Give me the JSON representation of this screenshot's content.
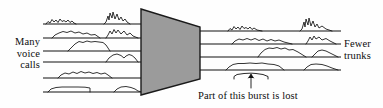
{
  "figure": {
    "background_color": "#fefefe",
    "line_color": "#111111",
    "funnel_fill_color": "#9b9b9b",
    "funnel_stroke_color": "#1a1a1a"
  },
  "labels": {
    "left": {
      "line1": "Many",
      "line2": "voice",
      "line3": "calls"
    },
    "right": {
      "line1": "Fewer",
      "line2": "trunks"
    },
    "caption": "Part of this burst is lost"
  },
  "diagram_data": {
    "type": "schematic",
    "input_channel_count": 6,
    "output_channel_count": 4,
    "input_lines": [
      {
        "index": 0,
        "y": 24,
        "x_start": 43,
        "x_end": 141,
        "bursts": [
          {
            "x": 46,
            "width": 30,
            "height": 6,
            "style": "spiky"
          },
          {
            "x": 104,
            "width": 26,
            "height": 12,
            "style": "spiky-tall"
          }
        ]
      },
      {
        "index": 1,
        "y": 38,
        "x_start": 43,
        "x_end": 141,
        "bursts": [
          {
            "x": 52,
            "width": 48,
            "height": 7,
            "style": "rounded"
          },
          {
            "x": 106,
            "width": 32,
            "height": 9,
            "style": "spiky"
          }
        ]
      },
      {
        "index": 2,
        "y": 51,
        "x_start": 43,
        "x_end": 141,
        "bursts": [
          {
            "x": 68,
            "width": 42,
            "height": 10,
            "style": "rounded"
          }
        ]
      },
      {
        "index": 3,
        "y": 62,
        "x_start": 43,
        "x_end": 141,
        "bursts": [
          {
            "x": 106,
            "width": 32,
            "height": 8,
            "style": "rounded"
          }
        ]
      },
      {
        "index": 4,
        "y": 78,
        "x_start": 43,
        "x_end": 141,
        "bursts": [
          {
            "x": 58,
            "width": 54,
            "height": 7,
            "style": "spiky"
          }
        ]
      },
      {
        "index": 5,
        "y": 92,
        "x_start": 43,
        "x_end": 141,
        "bursts": [
          {
            "x": 48,
            "width": 42,
            "height": 6,
            "style": "flat"
          },
          {
            "x": 114,
            "width": 28,
            "height": 6,
            "style": "rounded"
          }
        ]
      }
    ],
    "output_lines": [
      {
        "index": 0,
        "y": 31,
        "x_start": 200,
        "x_end": 341,
        "bursts": [
          {
            "x": 228,
            "width": 36,
            "height": 6,
            "style": "spiky"
          },
          {
            "x": 300,
            "width": 32,
            "height": 13,
            "style": "spiky-tall"
          }
        ]
      },
      {
        "index": 1,
        "y": 44,
        "x_start": 200,
        "x_end": 341,
        "bursts": [
          {
            "x": 232,
            "width": 60,
            "height": 7,
            "style": "spiky"
          },
          {
            "x": 306,
            "width": 30,
            "height": 8,
            "style": "spiky"
          }
        ]
      },
      {
        "index": 2,
        "y": 57,
        "x_start": 200,
        "x_end": 341,
        "bursts": [
          {
            "x": 258,
            "width": 48,
            "height": 9,
            "style": "rounded"
          },
          {
            "x": 312,
            "width": 26,
            "height": 7,
            "style": "rounded"
          }
        ]
      },
      {
        "index": 3,
        "y": 70,
        "x_start": 200,
        "x_end": 341,
        "bursts": [
          {
            "x": 226,
            "width": 58,
            "height": 7,
            "style": "rounded"
          },
          {
            "x": 304,
            "width": 34,
            "height": 7,
            "style": "rounded"
          }
        ]
      }
    ],
    "funnel": {
      "shape": "trapezoid",
      "left_x": 141,
      "right_x": 200,
      "left_top_y": 9,
      "left_bottom_y": 95,
      "right_top_y": 27,
      "right_bottom_y": 79
    },
    "annotation": {
      "brace_x_start": 234,
      "brace_x_end": 270,
      "brace_y": 76,
      "arrow_x": 252,
      "arrow_y_start": 79,
      "arrow_y_end": 88,
      "text": "Part of this burst is lost"
    }
  }
}
